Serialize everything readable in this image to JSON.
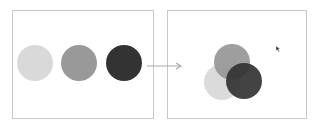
{
  "diagram": {
    "left_panel": {
      "circles": [
        {
          "name": "light",
          "color": "#d9d9d9",
          "cx": 35,
          "cy": 63,
          "r": 18
        },
        {
          "name": "medium",
          "color": "#999999",
          "cx": 79,
          "cy": 63,
          "r": 18
        },
        {
          "name": "dark",
          "color": "#333333",
          "cx": 124,
          "cy": 63,
          "r": 18
        }
      ]
    },
    "arrow": {
      "color": "#aaaaaa",
      "from": [
        147,
        66
      ],
      "to": [
        181,
        66
      ]
    },
    "right_panel": {
      "circles": [
        {
          "name": "light",
          "color": "#d9d9d9",
          "cx": 222,
          "cy": 82,
          "r": 18
        },
        {
          "name": "medium",
          "color": "#999999",
          "cx": 232,
          "cy": 62,
          "r": 18
        },
        {
          "name": "dark",
          "color": "#333333",
          "cx": 244,
          "cy": 81,
          "r": 18
        }
      ],
      "cursor": {
        "x": 276,
        "y": 46
      }
    }
  }
}
